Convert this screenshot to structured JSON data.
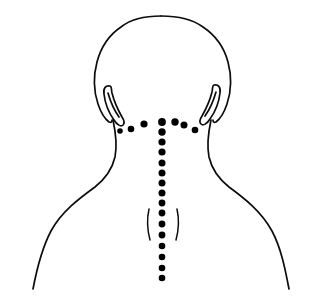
{
  "figure": {
    "title": "Posterior view of head, neck and shoulders with marked points",
    "view": "posterior",
    "background_color": "#ffffff",
    "line_color": "#0d0d0d",
    "point_color": "#000000",
    "canvas": {
      "width": 319,
      "height": 300
    }
  },
  "chart_data": {
    "type": "scatter",
    "title": "Posterior view of head, neck and shoulders with marked points",
    "xlabel": "",
    "ylabel": "",
    "xlim": [
      0,
      319
    ],
    "ylim": [
      0,
      300
    ],
    "grid": false,
    "legend": "none",
    "series": [
      {
        "name": "occipital-arc-points",
        "count": 7,
        "marker": "filled-circle",
        "color": "#000000",
        "points": [
          {
            "x": 131,
            "y": 129,
            "r": 3.3
          },
          {
            "x": 144,
            "y": 124,
            "r": 3.6
          },
          {
            "x": 162,
            "y": 122,
            "r": 3.9
          },
          {
            "x": 175,
            "y": 122,
            "r": 3.7
          },
          {
            "x": 184,
            "y": 125,
            "r": 3.5
          },
          {
            "x": 195,
            "y": 130,
            "r": 3.3
          },
          {
            "x": 120,
            "y": 131,
            "r": 2.8
          }
        ]
      },
      {
        "name": "spinal-midline-points",
        "count": 16,
        "marker": "filled-circle",
        "color": "#000000",
        "points": [
          {
            "x": 162,
            "y": 122,
            "r": 3.9
          },
          {
            "x": 162,
            "y": 132,
            "r": 3.7
          },
          {
            "x": 162,
            "y": 142,
            "r": 3.6
          },
          {
            "x": 162,
            "y": 152,
            "r": 3.6
          },
          {
            "x": 162,
            "y": 163,
            "r": 3.5
          },
          {
            "x": 162,
            "y": 173,
            "r": 3.5
          },
          {
            "x": 162,
            "y": 183,
            "r": 3.5
          },
          {
            "x": 162,
            "y": 193,
            "r": 3.5
          },
          {
            "x": 162,
            "y": 203,
            "r": 3.4
          },
          {
            "x": 162,
            "y": 213,
            "r": 3.4
          },
          {
            "x": 162,
            "y": 224,
            "r": 3.4
          },
          {
            "x": 162,
            "y": 235,
            "r": 3.4
          },
          {
            "x": 162,
            "y": 246,
            "r": 3.3
          },
          {
            "x": 162,
            "y": 257,
            "r": 3.3
          },
          {
            "x": 162,
            "y": 268,
            "r": 3.3
          },
          {
            "x": 162,
            "y": 278,
            "r": 3.3
          }
        ]
      }
    ],
    "annotations": [
      {
        "name": "head-outline",
        "kind": "contour"
      },
      {
        "name": "left-ear",
        "kind": "contour"
      },
      {
        "name": "right-ear",
        "kind": "contour"
      },
      {
        "name": "neck-and-shoulders",
        "kind": "contour"
      },
      {
        "name": "left-scapular-line",
        "kind": "contour"
      },
      {
        "name": "right-scapular-line",
        "kind": "contour"
      }
    ]
  },
  "paths": {
    "head_outline": "M 162,16 C 186,16 205,25 217,40 C 228,54 232,72 230,88 C 229,98 227,106 224,112 C 222,117 220,120 218,121",
    "head_outline_left": "M 162,16 C 140,16 122,24 111,38 C 100,52 96,70 97,86 C 98,97 100,105 103,111 C 105,116 107,119 109,121",
    "left_ear": "M 108,88 C 104,88 102,91 103,96 C 104,103 108,112 113,119 C 116,123 119,125 122,124 C 124,123 124,120 122,117 C 118,111 114,102 112,95 C 111,90 110,88 108,88 Z",
    "left_ear_inner": "M 109,93 C 111,99 115,109 119,116",
    "right_ear": "M 212,87 C 216,87 218,90 217,95 C 216,102 212,111 207,118 C 204,122 201,124 198,123 C 196,122 196,119 198,116 C 202,110 206,101 208,94 C 209,89 210,87 212,87 Z",
    "right_ear_inner": "M 211,92 C 209,98 205,108 201,115",
    "neck_left": "M 110,120 C 112,133 113,146 112,156 C 110,170 104,180 94,189 C 80,201 62,216 52,236 C 44,252 38,268 34,288",
    "neck_right": "M 214,120 C 212,133 211,146 212,156 C 214,170 221,180 231,189 C 245,201 261,216 270,236 C 277,252 282,268 287,288",
    "left_scapula": "M 150,211 C 148,219 148,228 150,238",
    "right_scapula": "M 176,211 C 178,219 178,228 176,238"
  }
}
